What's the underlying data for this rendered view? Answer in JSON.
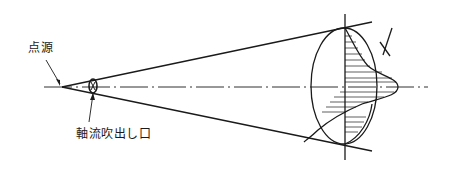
{
  "diagram": {
    "labels": {
      "point_source": "点源",
      "axial_outlet": "軸流吹出し口"
    },
    "colors": {
      "line": "#1a1a1a",
      "background": "#ffffff"
    }
  }
}
